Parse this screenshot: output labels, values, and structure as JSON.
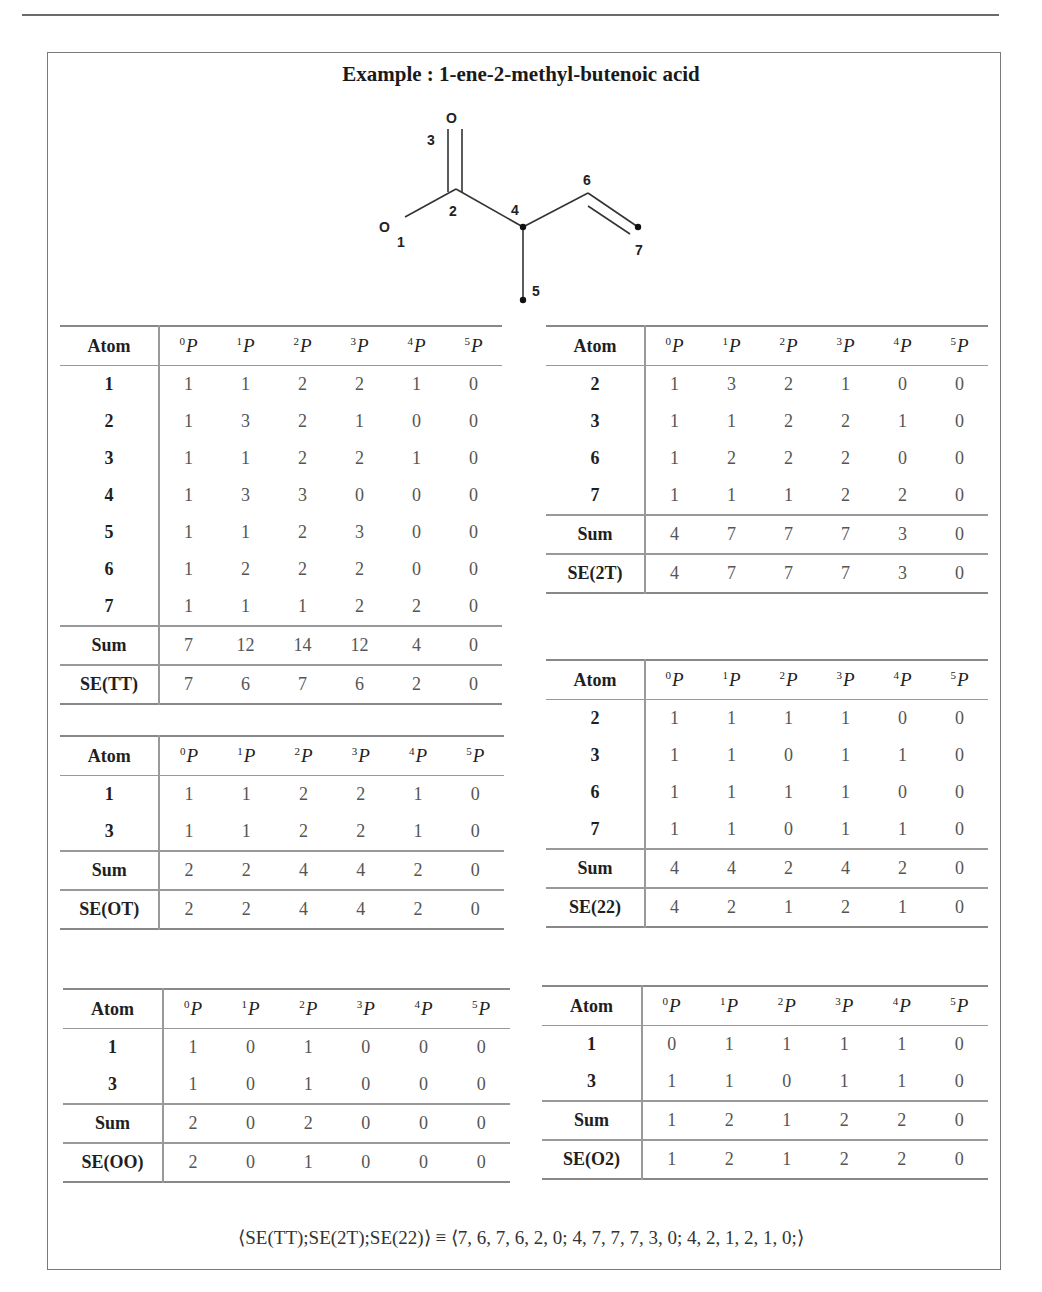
{
  "title": "Example : 1-ene-2-methyl-butenoic acid",
  "molecule": {
    "name": "1-ene-2-methyl-butenoic acid",
    "atoms": [
      {
        "id": "1",
        "symbol": "O"
      },
      {
        "id": "2",
        "symbol": "C"
      },
      {
        "id": "3",
        "symbol": "O"
      },
      {
        "id": "4",
        "symbol": "C"
      },
      {
        "id": "5",
        "symbol": "C"
      },
      {
        "id": "6",
        "symbol": "C"
      },
      {
        "id": "7",
        "symbol": "C"
      }
    ],
    "labels": {
      "o1": "O",
      "o3": "O",
      "n1": "1",
      "n2": "2",
      "n3": "3",
      "n4": "4",
      "n5": "5",
      "n6": "6",
      "n7": "7"
    }
  },
  "header": {
    "atom": "Atom",
    "p_sup": [
      "0",
      "1",
      "2",
      "3",
      "4",
      "5"
    ],
    "p": "P"
  },
  "tables": {
    "tt": {
      "rows": [
        {
          "atom": "1",
          "v": [
            "1",
            "1",
            "2",
            "2",
            "1",
            "0"
          ]
        },
        {
          "atom": "2",
          "v": [
            "1",
            "3",
            "2",
            "1",
            "0",
            "0"
          ]
        },
        {
          "atom": "3",
          "v": [
            "1",
            "1",
            "2",
            "2",
            "1",
            "0"
          ]
        },
        {
          "atom": "4",
          "v": [
            "1",
            "3",
            "3",
            "0",
            "0",
            "0"
          ]
        },
        {
          "atom": "5",
          "v": [
            "1",
            "1",
            "2",
            "3",
            "0",
            "0"
          ]
        },
        {
          "atom": "6",
          "v": [
            "1",
            "2",
            "2",
            "2",
            "0",
            "0"
          ]
        },
        {
          "atom": "7",
          "v": [
            "1",
            "1",
            "1",
            "2",
            "2",
            "0"
          ]
        }
      ],
      "sum": {
        "label": "Sum",
        "v": [
          "7",
          "12",
          "14",
          "12",
          "4",
          "0"
        ]
      },
      "se": {
        "label": "SE(TT)",
        "v": [
          "7",
          "6",
          "7",
          "6",
          "2",
          "0"
        ]
      }
    },
    "t2t": {
      "rows": [
        {
          "atom": "2",
          "v": [
            "1",
            "3",
            "2",
            "1",
            "0",
            "0"
          ]
        },
        {
          "atom": "3",
          "v": [
            "1",
            "1",
            "2",
            "2",
            "1",
            "0"
          ]
        },
        {
          "atom": "6",
          "v": [
            "1",
            "2",
            "2",
            "2",
            "0",
            "0"
          ]
        },
        {
          "atom": "7",
          "v": [
            "1",
            "1",
            "1",
            "2",
            "2",
            "0"
          ]
        }
      ],
      "sum": {
        "label": "Sum",
        "v": [
          "4",
          "7",
          "7",
          "7",
          "3",
          "0"
        ]
      },
      "se": {
        "label": "SE(2T)",
        "v": [
          "4",
          "7",
          "7",
          "7",
          "3",
          "0"
        ]
      }
    },
    "ot": {
      "rows": [
        {
          "atom": "1",
          "v": [
            "1",
            "1",
            "2",
            "2",
            "1",
            "0"
          ]
        },
        {
          "atom": "3",
          "v": [
            "1",
            "1",
            "2",
            "2",
            "1",
            "0"
          ]
        }
      ],
      "sum": {
        "label": "Sum",
        "v": [
          "2",
          "2",
          "4",
          "4",
          "2",
          "0"
        ]
      },
      "se": {
        "label": "SE(OT)",
        "v": [
          "2",
          "2",
          "4",
          "4",
          "2",
          "0"
        ]
      }
    },
    "t22": {
      "rows": [
        {
          "atom": "2",
          "v": [
            "1",
            "1",
            "1",
            "1",
            "0",
            "0"
          ]
        },
        {
          "atom": "3",
          "v": [
            "1",
            "1",
            "0",
            "1",
            "1",
            "0"
          ]
        },
        {
          "atom": "6",
          "v": [
            "1",
            "1",
            "1",
            "1",
            "0",
            "0"
          ]
        },
        {
          "atom": "7",
          "v": [
            "1",
            "1",
            "0",
            "1",
            "1",
            "0"
          ]
        }
      ],
      "sum": {
        "label": "Sum",
        "v": [
          "4",
          "4",
          "2",
          "4",
          "2",
          "0"
        ]
      },
      "se": {
        "label": "SE(22)",
        "v": [
          "4",
          "2",
          "1",
          "2",
          "1",
          "0"
        ]
      }
    },
    "oo": {
      "rows": [
        {
          "atom": "1",
          "v": [
            "1",
            "0",
            "1",
            "0",
            "0",
            "0"
          ]
        },
        {
          "atom": "3",
          "v": [
            "1",
            "0",
            "1",
            "0",
            "0",
            "0"
          ]
        }
      ],
      "sum": {
        "label": "Sum",
        "v": [
          "2",
          "0",
          "2",
          "0",
          "0",
          "0"
        ]
      },
      "se": {
        "label": "SE(OO)",
        "v": [
          "2",
          "0",
          "1",
          "0",
          "0",
          "0"
        ]
      }
    },
    "o2": {
      "rows": [
        {
          "atom": "1",
          "v": [
            "0",
            "1",
            "1",
            "1",
            "1",
            "0"
          ]
        },
        {
          "atom": "3",
          "v": [
            "1",
            "1",
            "0",
            "1",
            "1",
            "0"
          ]
        }
      ],
      "sum": {
        "label": "Sum",
        "v": [
          "1",
          "2",
          "1",
          "2",
          "2",
          "0"
        ]
      },
      "se": {
        "label": "SE(O2)",
        "v": [
          "1",
          "2",
          "1",
          "2",
          "2",
          "0"
        ]
      }
    }
  },
  "formula": "⟨SE(TT);SE(2T);SE(22)⟩ ≡ ⟨7, 6, 7, 6, 2, 0; 4, 7, 7, 7, 3, 0; 4, 2, 1, 2, 1, 0;⟩"
}
